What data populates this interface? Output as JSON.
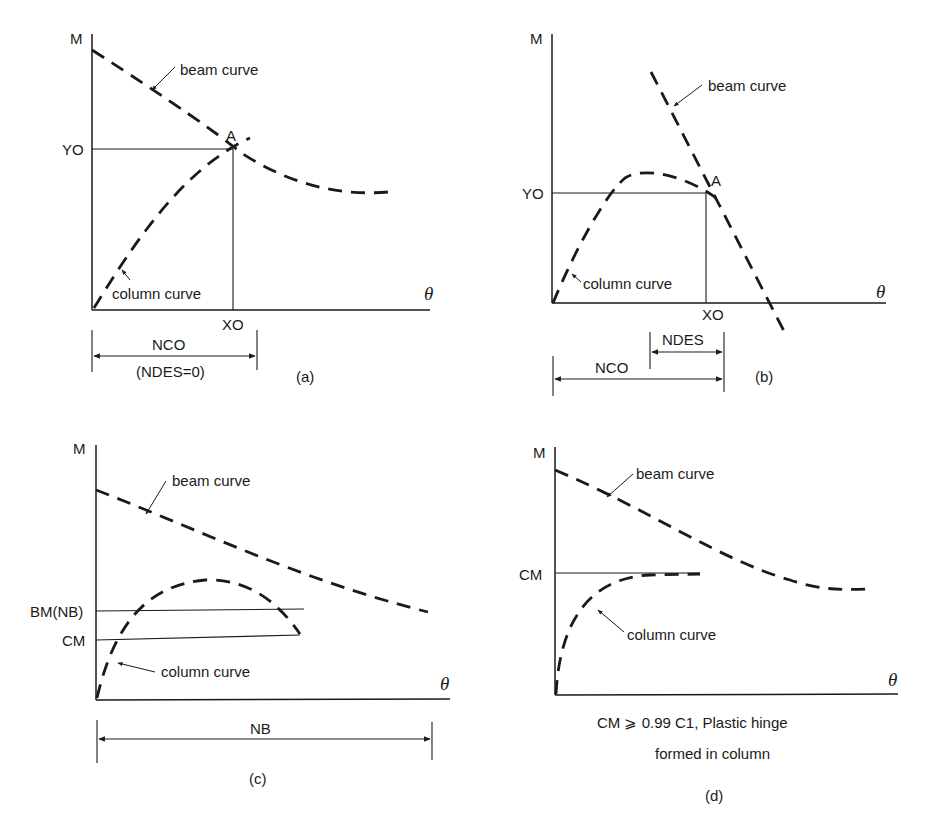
{
  "figure": {
    "panels": [
      {
        "id": "a",
        "caption": "(a)",
        "y_axis_label": "M",
        "x_axis_label": "θ",
        "beam_label": "beam curve",
        "column_label": "column curve",
        "point_label": "A",
        "y_marker": "YO",
        "x_marker": "XO",
        "dimension_label": "NCO",
        "dimension_sublabel": "(NDES=0)"
      },
      {
        "id": "b",
        "caption": "(b)",
        "y_axis_label": "M",
        "x_axis_label": "θ",
        "beam_label": "beam curve",
        "column_label": "column curve",
        "point_label": "A",
        "y_marker": "YO",
        "x_marker": "XO",
        "dimension_label_1": "NDES",
        "dimension_label_2": "NCO"
      },
      {
        "id": "c",
        "caption": "(c)",
        "y_axis_label": "M",
        "x_axis_label": "θ",
        "beam_label": "beam curve",
        "column_label": "column curve",
        "y_marker_1": "BM(NB)",
        "y_marker_2": "CM",
        "dimension_label": "NB"
      },
      {
        "id": "d",
        "caption": "(d)",
        "y_axis_label": "M",
        "x_axis_label": "θ",
        "beam_label": "beam curve",
        "column_label": "column curve",
        "y_marker": "CM",
        "note_line_1": "CM ⩾ 0.99  C1, Plastic hinge",
        "note_line_2": "formed in column"
      }
    ]
  }
}
